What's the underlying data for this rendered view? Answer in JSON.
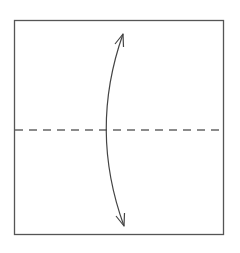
{
  "diagram": {
    "type": "origami-fold-step",
    "paper": {
      "x": 14,
      "y": 20,
      "width": 210,
      "height": 215,
      "stroke": "#555555"
    },
    "fold_line": {
      "style": "dashed",
      "orientation": "horizontal",
      "y": 130,
      "x1": 15,
      "x2": 223,
      "stroke": "#666666",
      "dash": "8 6"
    },
    "arrow": {
      "kind": "double-headed-curved",
      "start": [
        123,
        34
      ],
      "end": [
        124,
        226
      ],
      "control": [
        89,
        130
      ],
      "stroke": "#444444"
    },
    "colors": {
      "background": "#ffffff",
      "line": "#555555"
    }
  }
}
